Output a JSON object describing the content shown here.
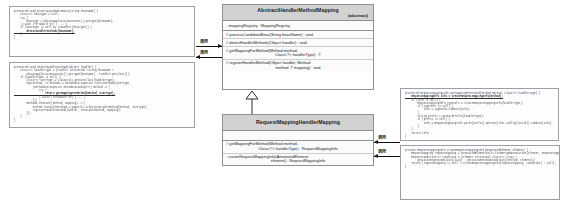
{
  "diagram": {
    "accent_header_bg": "#d2d2d2",
    "border_color": "#8c9196",
    "arrow_color": "#111111"
  },
  "uml": {
    "abstract_class": {
      "name": "AbstractHandlerMethodMapping",
      "stereotype": "(abstract)",
      "attributes": [
        "- mappingRegistry : MappingRegistry"
      ],
      "methods": [
        {
          "line1": "# processCandidateBean(String beanName) : void",
          "line2": ""
        },
        {
          "line1": "# detectHandlerMethods(Object handler) : void",
          "line2": ""
        },
        {
          "line1": "# getMappingForMethod(Method method,",
          "line2": "Class<?> handlerType) : T"
        },
        {
          "line1": "# registerHandlerMethod(Object handler, Method",
          "line2": "method, T mapping) : void"
        }
      ]
    },
    "concrete_class": {
      "name": "RequestMappingHandlerMapping",
      "stereotype": "",
      "attributes": [],
      "methods": [
        {
          "line1": "# getMappingForMethod(Method method,",
          "line2": "Class<?> handlerType) : RequestMappingInfo"
        },
        {
          "line1": "- createRequestMappingInfo(AnnotatedElement",
          "line2": "element) : RequestMappingInfo"
        }
      ]
    }
  },
  "connectors": {
    "inheritance_label": "extends",
    "arrows": [
      {
        "id": "arrow-1",
        "label": "调用"
      },
      {
        "id": "arrow-2",
        "label": "调用"
      },
      {
        "id": "arrow-3",
        "label": "调用"
      },
      {
        "id": "arrow-4",
        "label": "调用"
      }
    ]
  },
  "code_panels": {
    "top_left": {
      "name": "processCandidateBean",
      "lines": [
        {
          "text": "protected void processCandidateBean(String beanName) {",
          "style": "kw"
        },
        {
          "text": "    Class<?> beanType = null;",
          "style": "plain"
        },
        {
          "text": "    try {",
          "style": "plain"
        },
        {
          "text": "        beanType = obtainApplicationContext().getType(beanName);",
          "style": "plain"
        },
        {
          "text": "    } catch (Throwable ex) { ... }",
          "style": "plain"
        },
        {
          "text": "    if (beanType != null && isHandler(beanType)) {",
          "style": "plain"
        },
        {
          "text": "        detectHandlerMethods(beanName);",
          "style": "hl"
        },
        {
          "text": "    }",
          "style": "plain"
        },
        {
          "text": "}",
          "style": "plain"
        }
      ]
    },
    "bottom_left": {
      "name": "detectHandlerMethods",
      "lines": [
        {
          "text": "protected void detectHandlerMethods(Object handler) {",
          "style": "kw"
        },
        {
          "text": "    Class<?> handlerType = (handler instanceof String beanName ?",
          "style": "plain"
        },
        {
          "text": "        obtainApplicationContext().getType(beanName) : handler.getClass());",
          "style": "plain"
        },
        {
          "text": "    if (handlerType != null) {",
          "style": "plain"
        },
        {
          "text": "        Class<?> userType = ClassUtils.getUserClass(handlerType);",
          "style": "plain"
        },
        {
          "text": "        Map<Method, T> methods = MethodIntrospector.selectMethods(userType,",
          "style": "plain"
        },
        {
          "text": "            (MethodIntrospector.MetadataLookup<T>) method -> {",
          "style": "plain"
        },
        {
          "text": "                try {",
          "style": "plain"
        },
        {
          "text": "                    return getMappingForMethod(method, userType);",
          "style": "hl"
        },
        {
          "text": "                } catch (Throwable ex) { ... }",
          "style": "plain"
        },
        {
          "text": "            });",
          "style": "plain"
        },
        {
          "text": "        methods.forEach((method, mapping) -> {",
          "style": "plain"
        },
        {
          "text": "            Method invocableMethod = AopUtils.selectInvocableMethod(method, userType);",
          "style": "plain"
        },
        {
          "text": "            registerHandlerMethod(handler, invocableMethod, mapping);",
          "style": "plain"
        },
        {
          "text": "        });",
          "style": "plain"
        },
        {
          "text": "    }",
          "style": "plain"
        },
        {
          "text": "}",
          "style": "plain"
        }
      ]
    },
    "right_top": {
      "name": "getMappingForMethod",
      "lines": [
        {
          "text": "protected RequestMappingInfo getMappingForMethod(Method method, Class<?> handlerType) {",
          "style": "kw"
        },
        {
          "text": "    RequestMappingInfo info = createRequestMappingInfo(method);",
          "style": "hl"
        },
        {
          "text": "    if (info != null) {",
          "style": "plain"
        },
        {
          "text": "        RequestMappingInfo typeInfo = createRequestMappingInfo(handlerType);",
          "style": "plain"
        },
        {
          "text": "        if (typeInfo != null) {",
          "style": "plain"
        },
        {
          "text": "            info = typeInfo.combine(info);",
          "style": "plain"
        },
        {
          "text": "        }",
          "style": "plain"
        },
        {
          "text": "        String prefix = getPathPrefix(handlerType);",
          "style": "plain"
        },
        {
          "text": "        if (prefix != null) {",
          "style": "plain"
        },
        {
          "text": "            info = RequestMappingInfo.paths(prefix).options(this.config).build().combine(info);",
          "style": "plain"
        },
        {
          "text": "        }",
          "style": "plain"
        },
        {
          "text": "    }",
          "style": "plain"
        },
        {
          "text": "    return info;",
          "style": "plain"
        },
        {
          "text": "}",
          "style": "plain"
        }
      ]
    },
    "right_bottom": {
      "name": "createRequestMappingInfo",
      "lines": [
        {
          "text": "private RequestMappingInfo createRequestMappingInfo(AnnotatedElement element) {",
          "style": "kw"
        },
        {
          "text": "    RequestMapping requestMapping = AnnotatedElementUtils.findMergedAnnotation(element, RequestMapping.class);",
          "style": "plain"
        },
        {
          "text": "    RequestCondition<?> condition = (element instanceof Class<?> clazz ?",
          "style": "plain"
        },
        {
          "text": "        getCustomTypeCondition(clazz) : getCustomMethodCondition((Method) element));",
          "style": "plain"
        },
        {
          "text": "    return (requestMapping != null ? createRequestMappingInfo(requestMapping, condition) : null);",
          "style": "plain"
        },
        {
          "text": "}",
          "style": "plain"
        }
      ]
    }
  }
}
